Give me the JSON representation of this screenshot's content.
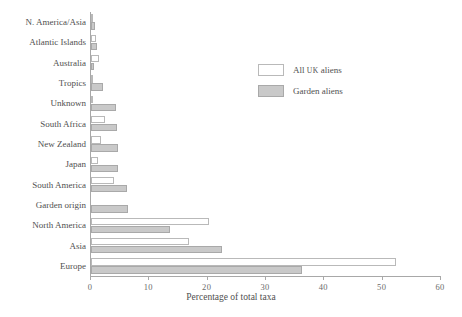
{
  "chart_data": {
    "type": "bar",
    "orientation": "horizontal",
    "title": "",
    "xlabel": "Percentage of total taxa",
    "ylabel": "",
    "xlim": [
      0,
      60
    ],
    "xticks": [
      0,
      10,
      20,
      30,
      40,
      50,
      60
    ],
    "grid": false,
    "legend_position": "upper right",
    "categories": [
      "N. America/Asia",
      "Atlantic Islands",
      "Australia",
      "Tropics",
      "Unknown",
      "South Africa",
      "New Zealand",
      "Japan",
      "South America",
      "Garden origin",
      "North America",
      "Asia",
      "Europe"
    ],
    "series": [
      {
        "name": "All UK aliens",
        "color": "#ffffff",
        "edge_color": "#b9b9b9",
        "values": [
          0.4,
          0.9,
          1.4,
          0.3,
          0.3,
          2.4,
          1.7,
          1.2,
          4.0,
          0.0,
          20.2,
          16.8,
          52.2
        ]
      },
      {
        "name": "Garden aliens",
        "color": "#c9c9c9",
        "edge_color": "#a9a9a9",
        "values": [
          0.7,
          1.0,
          0.5,
          2.0,
          4.3,
          4.4,
          4.7,
          4.6,
          6.2,
          6.4,
          13.5,
          22.5,
          36.2
        ]
      }
    ]
  },
  "legend": {
    "items": [
      {
        "label_main": "All ",
        "label_sc": "UK",
        "label_tail": " aliens",
        "swatch": "white"
      },
      {
        "label_main": "Garden aliens",
        "label_sc": "",
        "label_tail": "",
        "swatch": "grey"
      }
    ]
  },
  "axis": {
    "x_title": "Percentage of total taxa",
    "x_tick_labels": [
      "0",
      "10",
      "20",
      "30",
      "40",
      "50",
      "60"
    ]
  }
}
